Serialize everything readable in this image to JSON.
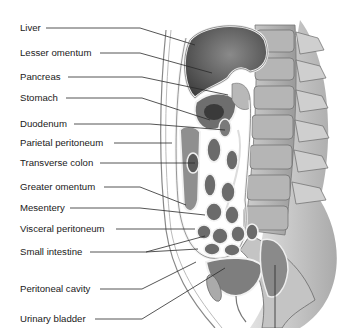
{
  "figure": {
    "title": "",
    "colors": {
      "background": "#ffffff",
      "line": "#2a2a2a",
      "text": "#1a1a1a"
    }
  },
  "labels": [
    {
      "text": "Liver",
      "y": 28
    },
    {
      "text": "Lesser omentum",
      "y": 53
    },
    {
      "text": "Pancreas",
      "y": 77
    },
    {
      "text": "Stomach",
      "y": 98
    },
    {
      "text": "Duodenum",
      "y": 124
    },
    {
      "text": "Parietal peritoneum",
      "y": 143
    },
    {
      "text": "Transverse colon",
      "y": 163
    },
    {
      "text": "Greater omentum",
      "y": 187
    },
    {
      "text": "Mesentery",
      "y": 208
    },
    {
      "text": "Visceral peritoneum",
      "y": 229
    },
    {
      "text": "Small intestine",
      "y": 252
    },
    {
      "text": "Peritoneal cavity",
      "y": 289
    },
    {
      "text": "Urinary bladder",
      "y": 319
    }
  ]
}
